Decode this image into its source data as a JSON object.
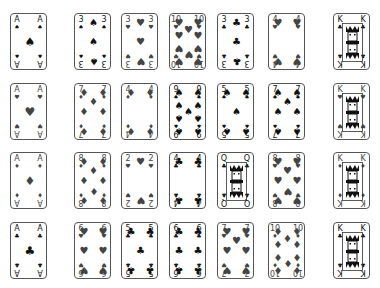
{
  "board": {
    "columns_x": [
      10,
      74,
      121,
      169,
      217,
      268,
      333
    ],
    "rows_y": [
      13,
      83,
      152,
      222
    ],
    "rows": [
      [
        {
          "rank": "A",
          "suit": "spade",
          "glyph": "♠"
        },
        {
          "rank": "3",
          "suit": "spade",
          "glyph": "♠"
        },
        {
          "rank": "3",
          "suit": "heart",
          "glyph": "♥"
        },
        {
          "rank": "10",
          "suit": "heart",
          "glyph": "♥"
        },
        {
          "rank": "3",
          "suit": "club",
          "glyph": "♣"
        },
        {
          "rank": "4",
          "suit": "heart",
          "glyph": "♥"
        },
        {
          "rank": "K",
          "suit": "club",
          "glyph": "♣"
        }
      ],
      [
        {
          "rank": "A",
          "suit": "heart",
          "glyph": "♥"
        },
        {
          "rank": "7",
          "suit": "diamond",
          "glyph": "♦"
        },
        {
          "rank": "4",
          "suit": "diamond",
          "glyph": "♦"
        },
        {
          "rank": "9",
          "suit": "spade",
          "glyph": "♠"
        },
        {
          "rank": "5",
          "suit": "spade",
          "glyph": "♠"
        },
        {
          "rank": "7",
          "suit": "spade",
          "glyph": "♠"
        },
        {
          "rank": "K",
          "suit": "heart",
          "glyph": "♥"
        }
      ],
      [
        {
          "rank": "A",
          "suit": "diamond",
          "glyph": "♦"
        },
        {
          "rank": "8",
          "suit": "diamond",
          "glyph": "♦"
        },
        {
          "rank": "2",
          "suit": "heart",
          "glyph": "♥"
        },
        {
          "rank": "4",
          "suit": "club",
          "glyph": "♣"
        },
        {
          "rank": "Q",
          "suit": "club",
          "glyph": "♣"
        },
        {
          "rank": "8",
          "suit": "heart",
          "glyph": "♥"
        },
        {
          "rank": "K",
          "suit": "diamond",
          "glyph": "♦"
        }
      ],
      [
        {
          "rank": "A",
          "suit": "club",
          "glyph": "♣"
        },
        {
          "rank": "6",
          "suit": "heart",
          "glyph": "♥"
        },
        {
          "rank": "5",
          "suit": "club",
          "glyph": "♣"
        },
        {
          "rank": "6",
          "suit": "club",
          "glyph": "♣"
        },
        {
          "rank": "7",
          "suit": "heart",
          "glyph": "♥"
        },
        {
          "rank": "10",
          "suit": "diamond",
          "glyph": "♦"
        },
        {
          "rank": "K",
          "suit": "club",
          "glyph": "♣"
        }
      ]
    ]
  },
  "colors": {
    "border": "#555555",
    "ink": "#111111",
    "background": "#ffffff"
  }
}
